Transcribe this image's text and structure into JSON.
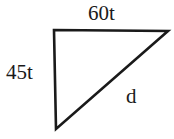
{
  "figure": {
    "type": "right-triangle-diagram",
    "background_color": "#ffffff",
    "stroke_color": "#1a1a1a",
    "stroke_width": 2.6,
    "text_color": "#1a1a1a",
    "vertices": {
      "top_left": [
        54,
        30
      ],
      "top_right": [
        168,
        31
      ],
      "bottom_left": [
        56,
        129
      ]
    },
    "right_angle_at": "top_left",
    "labels": {
      "top_edge": "60t",
      "left_edge": "45t",
      "hypotenuse": "d"
    }
  },
  "chart_data": {
    "type": "diagram",
    "title": "",
    "shape": "right triangle",
    "sides": [
      {
        "name": "top",
        "label": "60t",
        "from": "top_left",
        "to": "top_right",
        "orientation": "horizontal"
      },
      {
        "name": "left",
        "label": "45t",
        "from": "top_left",
        "to": "bottom_left",
        "orientation": "vertical"
      },
      {
        "name": "hypotenuse",
        "label": "d",
        "from": "bottom_left",
        "to": "top_right",
        "orientation": "diagonal"
      }
    ]
  }
}
